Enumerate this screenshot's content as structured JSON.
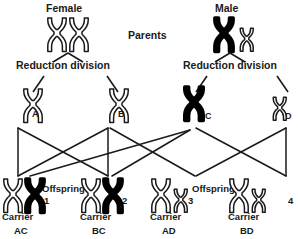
{
  "labels": {
    "female": "Female",
    "male": "Male",
    "parents": "Parents",
    "reduction_division_left": "Reduction division",
    "reduction_division_right": "Reduction division",
    "offspring_left": "Offspring",
    "offspring_right": "Offspring"
  },
  "gametes": [
    {
      "id": "A",
      "label": "A",
      "fill": "white",
      "size": "large"
    },
    {
      "id": "B",
      "label": "B",
      "fill": "white",
      "size": "large"
    },
    {
      "id": "C",
      "label": "C",
      "fill": "black",
      "size": "large"
    },
    {
      "id": "D",
      "label": "D",
      "fill": "white",
      "size": "small"
    }
  ],
  "offspring": [
    {
      "number": "1",
      "status": "Carrier",
      "genotype": "AC",
      "chromosomes": [
        "white-large",
        "black-large"
      ]
    },
    {
      "number": "2",
      "status": "Carrier",
      "genotype": "BC",
      "chromosomes": [
        "white-large",
        "black-large"
      ]
    },
    {
      "number": "3",
      "status": "Carrier",
      "genotype": "AD",
      "chromosomes": [
        "white-large",
        "white-small"
      ]
    },
    {
      "number": "4",
      "status": "Carrier",
      "genotype": "BD",
      "chromosomes": [
        "white-large",
        "white-small"
      ]
    }
  ],
  "parents": {
    "female": {
      "chromosomes": [
        "white-large",
        "white-large"
      ]
    },
    "male": {
      "chromosomes": [
        "black-large",
        "white-small"
      ]
    }
  },
  "colors": {
    "outline": "#1a1a1a",
    "filled": "#000000",
    "background": "#ffffff",
    "text": "#1a1a1a"
  }
}
